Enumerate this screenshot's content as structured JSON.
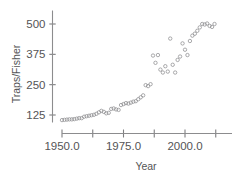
{
  "chart_data": {
    "type": "scatter",
    "title": "",
    "xlabel": "Year",
    "ylabel": "Traps/Fisher",
    "xlim": [
      1948.5,
      2013.5
    ],
    "ylim": [
      95,
      520
    ],
    "grid": false,
    "legend": null,
    "marker": "open-circle",
    "marker_color": "#8e8e90",
    "x_ticks_major": [
      "1950.0",
      "1975.0",
      "2000.0"
    ],
    "x_tick_values_major": [
      1950,
      1975,
      2000
    ],
    "x_tick_values_minor": [
      1962.5,
      1987.5,
      2012.5
    ],
    "y_ticks": [
      "125",
      "250",
      "375",
      "500"
    ],
    "y_tick_values": [
      125,
      250,
      375,
      500
    ],
    "x": [
      1950,
      1951,
      1952,
      1953,
      1954,
      1955,
      1956,
      1957,
      1958,
      1959,
      1960,
      1961,
      1962,
      1963,
      1964,
      1965,
      1966,
      1967,
      1968,
      1969,
      1970,
      1971,
      1972,
      1973,
      1974,
      1975,
      1976,
      1977,
      1978,
      1979,
      1980,
      1981,
      1982,
      1983,
      1984,
      1985,
      1986,
      1987,
      1988,
      1989,
      1990,
      1991,
      1992,
      1993,
      1994,
      1995,
      1996,
      1997,
      1998,
      1999,
      2000,
      2001,
      2002,
      2003,
      2004,
      2005,
      2006,
      2007,
      2008,
      2009,
      2010,
      2011,
      2012
    ],
    "y": [
      104,
      105,
      106,
      107,
      107,
      108,
      110,
      112,
      112,
      118,
      120,
      122,
      124,
      126,
      130,
      136,
      142,
      138,
      132,
      134,
      150,
      152,
      148,
      146,
      166,
      170,
      174,
      172,
      176,
      180,
      182,
      190,
      198,
      206,
      248,
      244,
      252,
      370,
      340,
      372,
      312,
      300,
      326,
      304,
      440,
      332,
      300,
      352,
      366,
      420,
      394,
      372,
      430,
      452,
      460,
      472,
      486,
      500,
      498,
      502,
      492,
      488,
      500
    ]
  },
  "axes": {
    "y_label": "Traps/Fisher",
    "x_label": "Year"
  }
}
